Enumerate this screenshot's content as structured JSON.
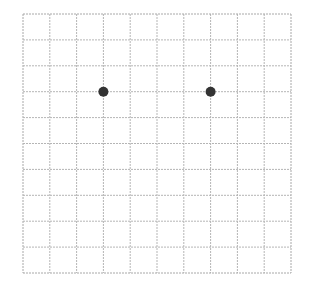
{
  "grid": {
    "columns": 10,
    "rows": 10,
    "left": 23,
    "top": 14,
    "width": 268,
    "height": 259,
    "line_color": "#b5b5b5",
    "border_color": "#a8a8a8"
  },
  "points": [
    {
      "col": 3,
      "row": 3,
      "color": "#333333",
      "radius": 5
    },
    {
      "col": 7,
      "row": 3,
      "color": "#333333",
      "radius": 5
    }
  ]
}
